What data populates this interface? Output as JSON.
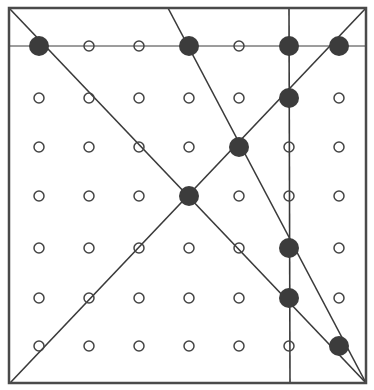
{
  "diagram": {
    "frame": {
      "x1": 9,
      "y1": 8,
      "x2": 366,
      "y2": 383,
      "stroke": "#4a4a4a"
    },
    "grid": {
      "columns": [
        39,
        89,
        139,
        189,
        239,
        289,
        339
      ],
      "rows": [
        46,
        98,
        147,
        196,
        248,
        298,
        346
      ],
      "open_dot_radius": 5,
      "filled_dot_radius": 10,
      "open_dot_stroke": "#444444",
      "filled_dot_color": "#3c3c3c"
    },
    "filled_dots": [
      {
        "col": 0,
        "row": 0
      },
      {
        "col": 3,
        "row": 0
      },
      {
        "col": 5,
        "row": 0
      },
      {
        "col": 6,
        "row": 0
      },
      {
        "col": 5,
        "row": 1
      },
      {
        "col": 4,
        "row": 2
      },
      {
        "col": 3,
        "row": 3
      },
      {
        "col": 5,
        "row": 4
      },
      {
        "col": 5,
        "row": 5
      },
      {
        "col": 6,
        "row": 6
      }
    ],
    "lines": [
      {
        "name": "horizontal-top-row-line",
        "x1": 9,
        "y1": 46,
        "x2": 366,
        "y2": 46,
        "width": 1
      },
      {
        "name": "diagonal-top-left-to-bottom-right",
        "x1": 9,
        "y1": 8,
        "x2": 366,
        "y2": 383,
        "width": 1.6
      },
      {
        "name": "diagonal-bottom-left-to-top-right",
        "x1": 10,
        "y1": 383,
        "x2": 366,
        "y2": 8,
        "width": 1.6
      },
      {
        "name": "vertical-line",
        "x1": 289,
        "y1": 8,
        "x2": 290,
        "y2": 383,
        "width": 1.6
      },
      {
        "name": "steep-line",
        "x1": 168,
        "y1": 8,
        "x2": 366,
        "y2": 383,
        "width": 1.6
      }
    ]
  }
}
